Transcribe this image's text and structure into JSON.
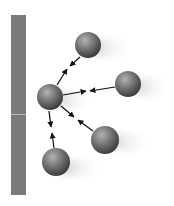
{
  "diagram": {
    "colors": {
      "background": "#ffffff",
      "wall": "#7a7a7a",
      "wall_divider": "#b9b9b9",
      "sphere_light": "#a8a8a8",
      "sphere_mid": "#6e6e6e",
      "sphere_dark": "#3a3a3a",
      "arrow": "#111111",
      "shadow": "#c8c8c8"
    },
    "wall": {
      "x": 11,
      "y": 15,
      "width": 15,
      "height": 180,
      "divider_y": 114
    },
    "central_sphere": {
      "id": "center",
      "cx": 50,
      "cy": 97,
      "r": 13
    },
    "spheres": [
      {
        "id": "top",
        "cx": 88,
        "cy": 45,
        "r": 13
      },
      {
        "id": "right",
        "cx": 128,
        "cy": 84,
        "r": 13
      },
      {
        "id": "lower-right",
        "cx": 105,
        "cy": 140,
        "r": 14
      },
      {
        "id": "bottom",
        "cx": 56,
        "cy": 162,
        "r": 14
      }
    ]
  }
}
